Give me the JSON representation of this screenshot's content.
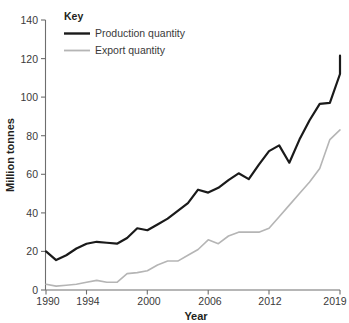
{
  "chart_data": {
    "type": "line",
    "title": "",
    "xlabel": "Year",
    "ylabel": "Million tonnes",
    "xlim": [
      1990,
      2019
    ],
    "ylim": [
      0,
      140
    ],
    "yticks": [
      0,
      20,
      40,
      60,
      80,
      100,
      120,
      140
    ],
    "xticks": [
      1990,
      1994,
      2000,
      2006,
      2012,
      2019
    ],
    "grid": false,
    "legend": {
      "title": "Key",
      "position": "top-left-inside",
      "entries": [
        {
          "name": "Production quantity",
          "color": "#1a1a1a"
        },
        {
          "name": "Export quantity",
          "color": "#b5b5b5"
        }
      ]
    },
    "x": [
      1990,
      1991,
      1992,
      1993,
      1994,
      1995,
      1996,
      1997,
      1998,
      1999,
      2000,
      2001,
      2002,
      2003,
      2004,
      2005,
      2006,
      2007,
      2008,
      2009,
      2010,
      2011,
      2012,
      2013,
      2014,
      2015,
      2016,
      2017,
      2018,
      2019
    ],
    "series": [
      {
        "name": "Production quantity",
        "color": "#1a1a1a",
        "width": 2.2,
        "values": [
          20,
          15.5,
          18,
          21.5,
          24,
          25,
          24.5,
          24,
          27,
          32,
          31,
          34,
          37,
          41,
          45,
          52,
          50.5,
          53,
          57,
          60.5,
          57.5,
          65,
          72,
          75,
          66,
          78,
          88,
          96.5,
          97,
          112
        ]
      },
      {
        "name": "Export quantity",
        "color": "#b5b5b5",
        "width": 1.6,
        "values": [
          3,
          2,
          2.5,
          3,
          4,
          5,
          4,
          4,
          8.5,
          9,
          10,
          13,
          15,
          15,
          18,
          21,
          26,
          24,
          28,
          30,
          30,
          30,
          32,
          38,
          44,
          50,
          56,
          63,
          78,
          83
        ]
      }
    ],
    "tail": {
      "production_last": 121.5,
      "export_last": 83
    }
  },
  "axis_labels": {
    "y": [
      "140",
      "120",
      "100",
      "80",
      "60",
      "40",
      "20",
      "0"
    ],
    "x": [
      "1990",
      "1994",
      "2000",
      "2006",
      "2012",
      "2019"
    ],
    "x_title": "Year",
    "y_title": "Million tonnes"
  },
  "legend": {
    "title": "Key",
    "item_production": "Production quantity",
    "item_export": "Export quantity"
  },
  "colors": {
    "production": "#1a1a1a",
    "export": "#b5b5b5",
    "axis": "#6e6e6e",
    "text": "#231f20",
    "background": "#ffffff"
  }
}
